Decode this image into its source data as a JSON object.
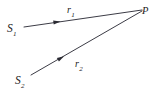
{
  "figure": {
    "background_color": "#ffffff",
    "stroke_color": "#3c3c46",
    "text_color": "#1a1a1a",
    "width": 158,
    "height": 96
  },
  "labels": {
    "source1": {
      "base": "S",
      "sub": "1",
      "name": "source-1"
    },
    "source2": {
      "base": "S",
      "sub": "2",
      "name": "source-2"
    },
    "vector1": {
      "base": "r",
      "sub": "1",
      "name": "vector-r1"
    },
    "vector2": {
      "base": "r",
      "sub": "2",
      "name": "vector-r2"
    },
    "point": {
      "base": "P",
      "sub": "",
      "name": "point-p"
    }
  },
  "geometry": {
    "point_p": {
      "x": 142,
      "y": 10
    },
    "rays": [
      {
        "id": "ray-r1",
        "from_label": "S1",
        "to_label": "P",
        "start": {
          "x": 24,
          "y": 27
        },
        "end": {
          "x": 142,
          "y": 10
        },
        "arrow_at": {
          "x": 57,
          "y": 22
        },
        "arrow_direction": "toward-P"
      },
      {
        "id": "ray-r2",
        "from_label": "S2",
        "to_label": "P",
        "start": {
          "x": 31,
          "y": 75
        },
        "end": {
          "x": 142,
          "y": 11
        },
        "arrow_at": {
          "x": 61,
          "y": 58
        },
        "arrow_direction": "toward-P"
      }
    ]
  }
}
